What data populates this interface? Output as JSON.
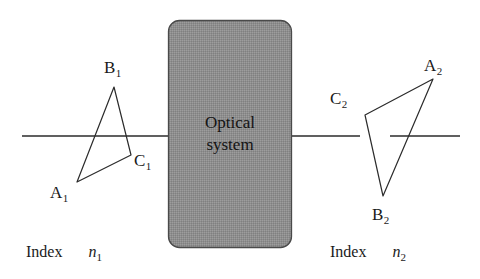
{
  "figure": {
    "background": "#ffffff",
    "line_color": "#2b2b2b",
    "box_fill": "#8e8e8e",
    "box_stroke": "#4a4a4a",
    "width": 480,
    "height": 279
  },
  "optical_system": {
    "line1": "Optical",
    "line2": "system",
    "box": {
      "x": 168,
      "y": 20,
      "width": 124,
      "height": 228,
      "radius": 11
    }
  },
  "axis": {
    "y": 136,
    "left": {
      "x1": 22,
      "x2": 168
    },
    "right_a": {
      "x1": 292,
      "x2": 360
    },
    "right_b": {
      "x1": 390,
      "x2": 460
    }
  },
  "object_triangle": {
    "name": "object-triangle",
    "vertices": [
      {
        "label": "B",
        "sub": "1",
        "x": 114,
        "y": 87
      },
      {
        "label": "C",
        "sub": "1",
        "x": 131,
        "y": 155
      },
      {
        "label": "A",
        "sub": "1",
        "x": 77,
        "y": 182
      }
    ],
    "labels": [
      {
        "id": "label-b1",
        "text": "B",
        "sub": "1",
        "left": 104,
        "top": 59
      },
      {
        "id": "label-c1",
        "text": "C",
        "sub": "1",
        "left": 134,
        "top": 152
      },
      {
        "id": "label-a1",
        "text": "A",
        "sub": "1",
        "left": 50,
        "top": 184
      }
    ]
  },
  "image_triangle": {
    "name": "image-triangle",
    "vertices": [
      {
        "label": "A",
        "sub": "2",
        "x": 433,
        "y": 79
      },
      {
        "label": "C",
        "sub": "2",
        "x": 365,
        "y": 115
      },
      {
        "label": "B",
        "sub": "2",
        "x": 383,
        "y": 196
      }
    ],
    "labels": [
      {
        "id": "label-a2",
        "text": "A",
        "sub": "2",
        "left": 424,
        "top": 57
      },
      {
        "id": "label-c2",
        "text": "C",
        "sub": "2",
        "left": 330,
        "top": 90
      },
      {
        "id": "label-b2",
        "text": "B",
        "sub": "2",
        "left": 372,
        "top": 206
      }
    ]
  },
  "index_left": {
    "word": "Index",
    "symbol": "n",
    "sub": "1",
    "left": 26,
    "top": 244
  },
  "index_right": {
    "word": "Index",
    "symbol": "n",
    "sub": "2",
    "left": 330,
    "top": 244
  }
}
